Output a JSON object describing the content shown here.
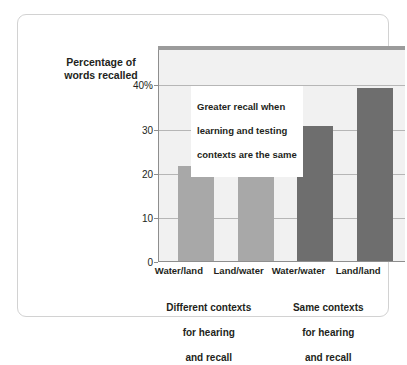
{
  "chart_data": {
    "type": "bar",
    "title": "",
    "subtitle": "",
    "xlabel": "",
    "ylabel": "Percentage of\nwords recalled",
    "ylabel_lines": [
      "Percentage of",
      "words recalled"
    ],
    "categories": [
      "Water/land",
      "Land/water",
      "Water/water",
      "Land/land"
    ],
    "values": [
      21.6,
      20.5,
      30.5,
      39.2
    ],
    "series": [
      {
        "name": "Percentage of words recalled",
        "values": [
          21.6,
          20.5,
          30.5,
          39.2
        ]
      }
    ],
    "bar_colors": [
      "#a8a8a8",
      "#a8a8a8",
      "#6e6e6e",
      "#6e6e6e"
    ],
    "ylim": [
      0,
      48
    ],
    "yticks": [
      0,
      10,
      20,
      30,
      40
    ],
    "ytick_labels": [
      "0",
      "10",
      "20",
      "30",
      "40%"
    ],
    "grid": true,
    "grid_axis": "y",
    "legend": false,
    "legend_position": "none",
    "annotations": [
      {
        "text": "Greater recall when\nlearning and testing\ncontexts are the same",
        "lines": [
          "Greater recall when",
          "learning and testing",
          "contexts are the same"
        ]
      }
    ],
    "group_captions": [
      {
        "text": "Different contexts\nfor hearing\nand recall",
        "lines": [
          "Different contexts",
          "for hearing",
          "and recall"
        ],
        "categories": [
          "Water/land",
          "Land/water"
        ]
      },
      {
        "text": "Same contexts\nfor hearing\nand recall",
        "lines": [
          "Same contexts",
          "for hearing",
          "and recall"
        ],
        "categories": [
          "Water/water",
          "Land/land"
        ]
      }
    ],
    "colors": {
      "plot_background": "#f1f1f1",
      "plot_top_band": "#9b9b9b",
      "gridline": "#b6b6b6",
      "axis": "#8e8e8e",
      "frame_border": "#d2d2d2",
      "text": "#231f20",
      "bar_light": "#a8a8a8",
      "bar_dark": "#6e6e6e",
      "callout_background": "#ffffff"
    }
  }
}
